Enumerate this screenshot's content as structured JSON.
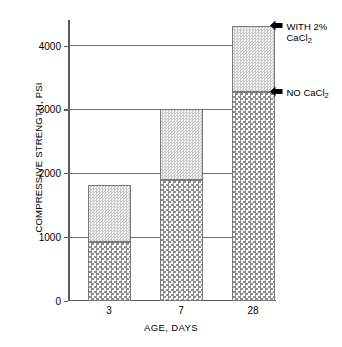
{
  "chart_data": {
    "type": "bar",
    "subtype": "stacked-bar",
    "title": "",
    "xlabel": "AGE, DAYS",
    "ylabel": "COMPRESSIVE STRENGTH, PSI",
    "categories": [
      "3",
      "7",
      "28"
    ],
    "series": [
      {
        "name": "NO CaCl2",
        "values": [
          920,
          1890,
          3270
        ]
      },
      {
        "name": "WITH 2% CaCl2",
        "values": [
          890,
          1110,
          1040
        ]
      }
    ],
    "totals": [
      1810,
      3000,
      4310
    ],
    "ylim": [
      0,
      4400
    ],
    "yticks": [
      0,
      1000,
      2000,
      3000,
      4000
    ],
    "ytick_labels": [
      "0",
      "1000",
      "2000",
      "3000",
      "4000"
    ],
    "grid": true,
    "legend": "none",
    "annotations": [
      {
        "label_line1": "WITH 2%",
        "label_line2": "CaCl",
        "sub2": "2",
        "points_to_value": 4310
      },
      {
        "label_line1": "NO CaCl",
        "sub1": "2",
        "label_line2": "",
        "points_to_value": 3270
      }
    ]
  },
  "axes": {
    "y_title": "COMPRESSIVE STRENGTH, PSI",
    "x_title": "AGE, DAYS"
  },
  "colors": {
    "grid": "#6e6e6e",
    "axis": "#5a5a5a",
    "bar_outline": "#7a7a7a",
    "arrow": "#000000",
    "background": "#ffffff"
  }
}
